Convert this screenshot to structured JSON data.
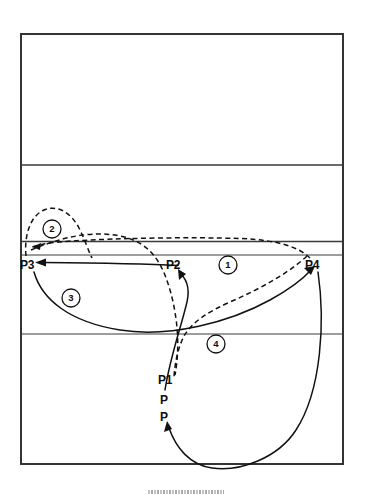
{
  "diagram": {
    "type": "volleyball-court-play-diagram",
    "court": {
      "outline": {
        "x": 21,
        "y": 34,
        "width": 322,
        "height": 430
      },
      "division_lines_y": [
        165,
        241,
        255,
        334
      ],
      "line_color": "#2b2b2b",
      "background_color": "#ffffff"
    },
    "player_labels": [
      {
        "id": "P3",
        "text": "P3",
        "x": 20,
        "y": 259
      },
      {
        "id": "P2",
        "text": "P2",
        "x": 166,
        "y": 259
      },
      {
        "id": "P4",
        "text": "P4",
        "x": 305,
        "y": 259
      },
      {
        "id": "P1",
        "text": "P1",
        "x": 158,
        "y": 374
      },
      {
        "id": "P-mid",
        "text": "P",
        "x": 160,
        "y": 394
      },
      {
        "id": "P-low",
        "text": "P",
        "x": 160,
        "y": 411
      }
    ],
    "step_markers": [
      {
        "id": "step-1",
        "text": "1",
        "cx": 228,
        "cy": 265,
        "r": 9
      },
      {
        "id": "step-2",
        "text": "2",
        "cx": 52,
        "cy": 229,
        "r": 9
      },
      {
        "id": "step-3",
        "text": "3",
        "cx": 71,
        "cy": 298,
        "r": 9
      },
      {
        "id": "step-4",
        "text": "4",
        "cx": 216,
        "cy": 344,
        "r": 9
      }
    ],
    "paths": [
      {
        "id": "path-1-p4-to-p3-dashed",
        "style": "dashed",
        "description": "long flat dashed arc from P4 across to near P3 with arrowhead at left"
      },
      {
        "id": "path-2-loop-dashed",
        "style": "dashed",
        "description": "dashed loop near P3 rising over circled 2"
      },
      {
        "id": "path-3-p3-to-p1-solid",
        "style": "solid",
        "description": "solid arc from P3 curving right and down toward P1 area"
      },
      {
        "id": "path-4-p1-to-p4-solid",
        "style": "solid",
        "description": "solid arc from P1 region up to P4 with arrowhead"
      },
      {
        "id": "path-p2-to-p3-solid",
        "style": "solid",
        "description": "straight solid line from P2 leftward to P3 with arrowhead"
      },
      {
        "id": "path-p1-to-p2-solid",
        "style": "solid",
        "description": "solid curve from lower court up to P2 with arrowhead"
      },
      {
        "id": "path-p4-to-bottom-solid",
        "style": "solid",
        "description": "long solid curve from P4 sweeping down and around to the P marker with arrowhead"
      },
      {
        "id": "path-dashed-center-down",
        "style": "dashed",
        "description": "dashed curve descending through center of court to P1"
      }
    ],
    "colors": {
      "ink": "#111111",
      "court_line": "#2b2b2b",
      "paper": "#ffffff"
    }
  }
}
